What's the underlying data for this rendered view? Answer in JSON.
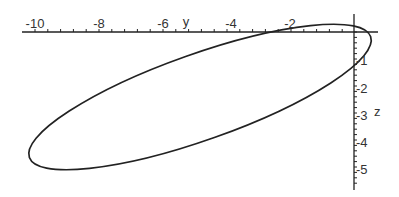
{
  "chart_data": {
    "type": "line",
    "title": "",
    "xlabel": "y",
    "ylabel": "z",
    "x_ticks": [
      "-10",
      "-8",
      "-6",
      "-4",
      "-2"
    ],
    "y_ticks": [
      "-1",
      "-2",
      "-3",
      "-4",
      "-5"
    ],
    "xlim": [
      -10.5,
      0.5
    ],
    "ylim": [
      -5.8,
      0.4
    ],
    "grid": false,
    "legend": null,
    "series": [
      {
        "name": "closed curve (ellipse)",
        "shape": "ellipse",
        "points_approx": [
          {
            "y": -5.0,
            "z": 0.0
          },
          {
            "y": -2.0,
            "z": 0.7
          },
          {
            "y": 0.0,
            "z": 0.25
          },
          {
            "y": 0.5,
            "z": -0.5
          },
          {
            "y": 0.0,
            "z": -1.8
          },
          {
            "y": -4.0,
            "z": -4.5
          },
          {
            "y": -8.0,
            "z": -5.35
          },
          {
            "y": -10.3,
            "z": -4.4
          },
          {
            "y": -8.0,
            "z": -2.2
          },
          {
            "y": -5.0,
            "z": 0.0
          }
        ]
      }
    ]
  },
  "axes": {
    "horizontal_label": "y",
    "vertical_label": "z",
    "horizontal_ticks": [
      {
        "label": "-10",
        "x": 35
      },
      {
        "label": "-8",
        "x": 99
      },
      {
        "label": "-6",
        "x": 163
      },
      {
        "label": "-4",
        "x": 227
      },
      {
        "label": "-2",
        "x": 290
      }
    ],
    "vertical_ticks": [
      {
        "label": "-1",
        "y": 60
      },
      {
        "label": "-2",
        "y": 88
      },
      {
        "label": "-3",
        "y": 115
      },
      {
        "label": "-4",
        "y": 142
      },
      {
        "label": "-5",
        "y": 169
      }
    ]
  }
}
